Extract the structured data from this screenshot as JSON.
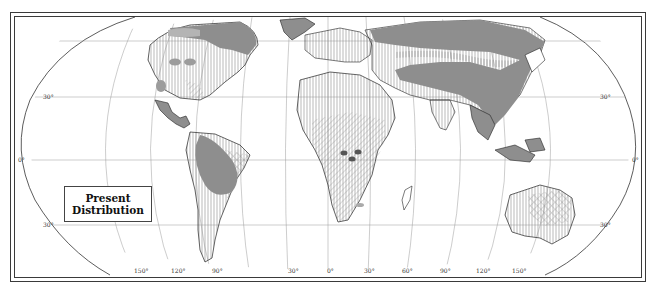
{
  "map": {
    "title_box": {
      "line1": "Present",
      "line2": "Distribution"
    },
    "projection": "Robinson-style world map",
    "latitude_labels": {
      "left": [
        "30°",
        "0°",
        "30°"
      ],
      "right": [
        "30°",
        "0°",
        "30°"
      ]
    },
    "longitude_labels": [
      "150°",
      "120°",
      "90°",
      "30°",
      "0°",
      "30°",
      "60°",
      "90°",
      "120°",
      "150°"
    ],
    "legend_fills": {
      "solid_gray": "#8c8c8c",
      "light_gray": "#b4b4b4",
      "vertical_hatch": "vertical lines",
      "diagonal_hatch": "diagonal lines",
      "crosshatch": "cross-hatch"
    },
    "colors": {
      "frame": "#3a3a3a",
      "land_outline": "#222222",
      "graticule": "#9a9a9a",
      "range_fill": "#8e8e8e",
      "background": "#ffffff"
    }
  }
}
